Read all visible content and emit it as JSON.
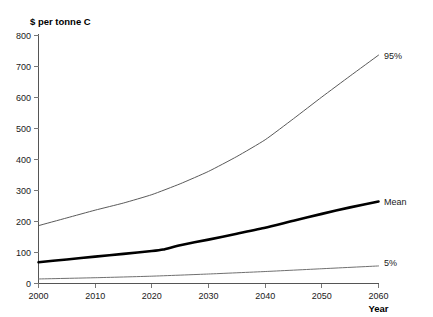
{
  "chart_data": {
    "type": "line",
    "title": "",
    "ylabel": "$ per tonne C",
    "xlabel": "Year",
    "xlim": [
      2000,
      2060
    ],
    "ylim": [
      0,
      800
    ],
    "xticks": [
      2000,
      2010,
      2020,
      2030,
      2040,
      2050,
      2060
    ],
    "yticks": [
      0,
      100,
      200,
      300,
      400,
      500,
      600,
      700,
      800
    ],
    "grid": false,
    "legend_position": "right-inline-end-of-line",
    "series": [
      {
        "name": "95%",
        "label": "95%",
        "color": "#5a5a5a",
        "line_width": 1.0,
        "x": [
          2000,
          2005,
          2010,
          2015,
          2020,
          2025,
          2030,
          2035,
          2040,
          2045,
          2050,
          2055,
          2060
        ],
        "values": [
          185,
          210,
          235,
          258,
          285,
          320,
          360,
          408,
          462,
          530,
          600,
          668,
          735
        ]
      },
      {
        "name": "Mean",
        "label": "Mean",
        "color": "#000000",
        "line_width": 2.6,
        "x": [
          2000,
          2005,
          2010,
          2015,
          2020,
          2022,
          2025,
          2030,
          2035,
          2040,
          2045,
          2050,
          2055,
          2060
        ],
        "values": [
          67,
          76,
          85,
          94,
          103,
          108,
          122,
          140,
          159,
          178,
          201,
          223,
          244,
          263
        ]
      },
      {
        "name": "5%",
        "label": "5%",
        "color": "#707070",
        "line_width": 1.0,
        "x": [
          2000,
          2010,
          2020,
          2030,
          2040,
          2050,
          2060
        ],
        "values": [
          13,
          17,
          22,
          29,
          37,
          46,
          55
        ]
      }
    ]
  },
  "labels": {
    "y_axis_title": "$ per tonne C",
    "x_axis_title": "Year",
    "tick_2000": "2000",
    "tick_2010": "2010",
    "tick_2020": "2020",
    "tick_2030": "2030",
    "tick_2040": "2040",
    "tick_2050": "2050",
    "tick_2060": "2060",
    "tick_0": "0",
    "tick_100": "100",
    "tick_200": "200",
    "tick_300": "300",
    "tick_400": "400",
    "tick_500": "500",
    "tick_600": "600",
    "tick_700": "700",
    "tick_800": "800",
    "series_95": "95%",
    "series_mean": "Mean",
    "series_5": "5%"
  },
  "colors": {
    "background": "#ffffff",
    "axis": "#555555",
    "mean_line": "#000000",
    "pct95_line": "#5a5a5a",
    "pct5_line": "#707070",
    "text": "#1a1a1a"
  }
}
